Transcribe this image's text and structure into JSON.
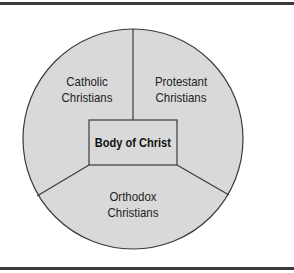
{
  "diagram": {
    "center": {
      "label": "Body of Christ"
    },
    "segments": [
      {
        "id": "catholic",
        "line1": "Catholic",
        "line2": "Christians"
      },
      {
        "id": "protestant",
        "line1": "Protestant",
        "line2": "Christians"
      },
      {
        "id": "orthodox",
        "line1": "Orthodox",
        "line2": "Christians"
      }
    ],
    "colors": {
      "fill": "#d9d9d9",
      "stroke": "#3a3a3a",
      "rule": "#3a3a3a"
    }
  }
}
